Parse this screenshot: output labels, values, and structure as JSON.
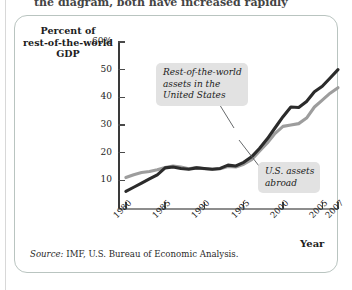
{
  "page": {
    "top_text_fragment": "the diagram, both have increased rapidly",
    "source_prefix": "Source:",
    "source_text": " IMF, U.S. Bureau of Economic Analysis."
  },
  "chart_data": {
    "type": "line",
    "title": "",
    "ylabel": "Percent of\nrest-of-the-world\nGDP",
    "ylabel_lines": [
      "Percent of",
      "rest-of-the-world",
      "GDP"
    ],
    "xlabel": "Year",
    "ylim": [
      0,
      60
    ],
    "yticks": [
      10,
      20,
      30,
      40,
      50,
      60
    ],
    "ytick_labels": [
      "10",
      "20",
      "30",
      "40",
      "50",
      "60%"
    ],
    "xlim": [
      1979,
      2007
    ],
    "xticks": [
      1980,
      1985,
      1990,
      1995,
      2000,
      2005,
      2007
    ],
    "xtick_labels": [
      "1980",
      "1985",
      "1990",
      "1995",
      "2000",
      "2005",
      "2007"
    ],
    "grid": false,
    "legend": "annotations",
    "x": [
      1980,
      1981,
      1982,
      1983,
      1984,
      1985,
      1986,
      1987,
      1988,
      1989,
      1990,
      1991,
      1992,
      1993,
      1994,
      1995,
      1996,
      1997,
      1998,
      1999,
      2000,
      2001,
      2002,
      2003,
      2004,
      2005,
      2006,
      2007
    ],
    "series": [
      {
        "name": "Rest-of-the-world assets in the United States",
        "color": "#2b2b2b",
        "values": [
          6,
          7.5,
          9,
          10.5,
          12,
          14.5,
          14.8,
          14.3,
          14.0,
          14.5,
          14.3,
          14.0,
          14.3,
          15.5,
          15.2,
          16.5,
          18.5,
          21.5,
          25,
          29,
          33,
          36.5,
          36.3,
          38.5,
          42,
          44,
          47,
          50
        ]
      },
      {
        "name": "U.S. assets abroad",
        "color": "#9d9d9d",
        "values": [
          11,
          12,
          12.8,
          13.2,
          13.8,
          14.6,
          15.2,
          14.8,
          14.2,
          14.6,
          14.2,
          14.0,
          14.2,
          15.0,
          14.8,
          15.8,
          17.5,
          20.5,
          23.5,
          27,
          29.5,
          30,
          30.5,
          32.5,
          36.5,
          39,
          41.5,
          43.5
        ]
      }
    ],
    "annotations": [
      {
        "id": "callout-rotw",
        "text": "Rest-of-the-world\nassets in the\nUnited States",
        "target_series": "Rest-of-the-world assets in the United States"
      },
      {
        "id": "callout-usa",
        "text": "U.S. assets\nabroad",
        "target_series": "U.S. assets abroad"
      }
    ]
  }
}
